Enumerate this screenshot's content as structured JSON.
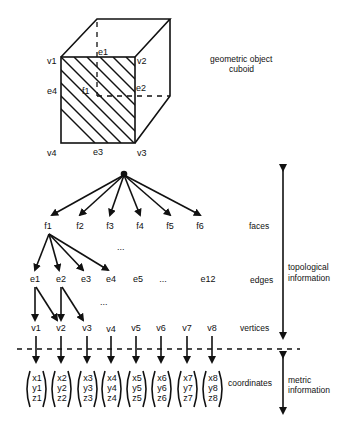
{
  "figure": {
    "geometric_object_label": [
      "geometric object",
      "cuboid"
    ],
    "cuboid_labels": {
      "vertices": [
        "v1",
        "v2",
        "v3",
        "v4"
      ],
      "edges": [
        "e1",
        "e2",
        "e3",
        "e4"
      ],
      "face": "f1"
    },
    "faces": [
      "f1",
      "f2",
      "f3",
      "f4",
      "f5",
      "f6"
    ],
    "edges": [
      "e1",
      "e2",
      "e3",
      "e4",
      "e5",
      "...",
      "e12"
    ],
    "vertices": [
      "v1",
      "v2",
      "v3",
      "v4",
      "v5",
      "v6",
      "v7",
      "v8"
    ],
    "coordinates": [
      [
        "x1",
        "y1",
        "z1"
      ],
      [
        "x2",
        "y2",
        "z2"
      ],
      [
        "x3",
        "y3",
        "z3"
      ],
      [
        "x4",
        "y4",
        "z4"
      ],
      [
        "x5",
        "y5",
        "z5"
      ],
      [
        "x6",
        "y6",
        "z6"
      ],
      [
        "x7",
        "y7",
        "z7"
      ],
      [
        "x8",
        "y8",
        "z8"
      ]
    ],
    "ellipsis": "...",
    "level_labels": {
      "faces": "faces",
      "edges": "edges",
      "vertices": "vertices",
      "coordinates": "coordinates"
    },
    "range_labels": {
      "topological": [
        "topological",
        "information"
      ],
      "metric": [
        "metric",
        "information"
      ]
    }
  }
}
